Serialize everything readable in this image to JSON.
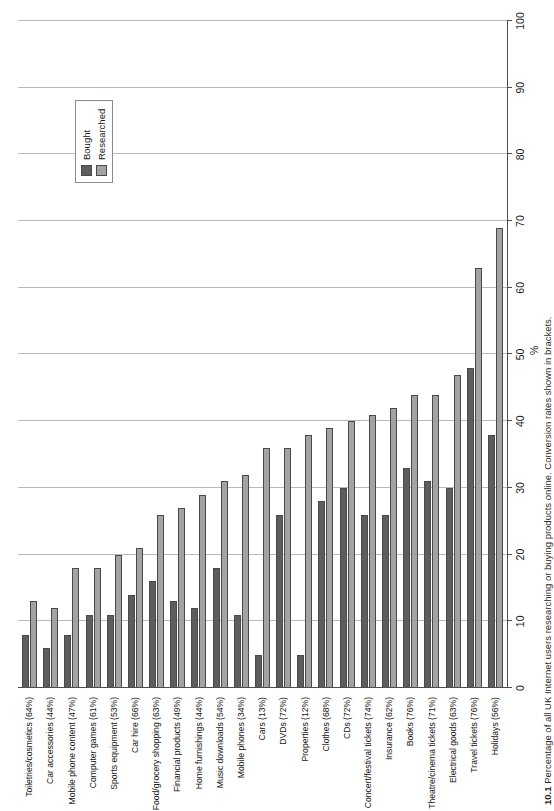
{
  "chart_data": {
    "type": "bar",
    "orientation": "vertical",
    "title": "",
    "xlabel": "",
    "ylabel": "%",
    "ylim": [
      0,
      100
    ],
    "ytick_step": 10,
    "yticks": [
      0,
      10,
      20,
      30,
      40,
      50,
      60,
      70,
      80,
      90,
      100
    ],
    "grid": true,
    "legend_position": "upper-left",
    "categories": [
      "Toiletries/cosmetics (64%)",
      "Car accessories (44%)",
      "Mobile phone content (47%)",
      "Computer games (61%)",
      "Sports equipment (53%)",
      "Car hire (66%)",
      "Food/grocery shopping (63%)",
      "Financial products (49%)",
      "Home furnishings (44%)",
      "Music downloads (54%)",
      "Mobile phones (34%)",
      "Cars (13%)",
      "DVDs (72%)",
      "Properties (12%)",
      "Clothes (68%)",
      "CDs (72%)",
      "Concert/festival tickets (74%)",
      "Insurance (62%)",
      "Books (76%)",
      "Theatre/cinema tickets (71%)",
      "Electrical goods (63%)",
      "Travel tickets (76%)",
      "Holidays (56%)"
    ],
    "series": [
      {
        "name": "Bought",
        "color": "#5d5d5d",
        "values": [
          8,
          6,
          8,
          11,
          11,
          14,
          16,
          13,
          12,
          18,
          11,
          5,
          26,
          5,
          28,
          30,
          26,
          26,
          33,
          31,
          30,
          48,
          38
        ]
      },
      {
        "name": "Researched",
        "color": "#a3a3a3",
        "values": [
          13,
          12,
          18,
          18,
          20,
          21,
          26,
          27,
          29,
          31,
          32,
          36,
          36,
          38,
          39,
          40,
          41,
          42,
          44,
          44,
          47,
          63,
          69
        ]
      }
    ]
  },
  "legend": {
    "items": [
      {
        "label": "Bought",
        "swatch": "bought"
      },
      {
        "label": "Researched",
        "swatch": "researched"
      }
    ]
  },
  "axis": {
    "y_title": "%",
    "tick_labels": [
      "0",
      "10",
      "20",
      "30",
      "40",
      "50",
      "60",
      "70",
      "80",
      "90",
      "100"
    ]
  },
  "caption": {
    "number": "10.1",
    "text": "Percentage of all UK Internet users researching or buying products online. Conversion rates shown in brackets."
  }
}
